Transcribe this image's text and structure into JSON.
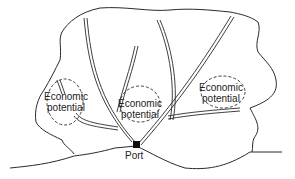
{
  "diagram": {
    "type": "map-schematic",
    "colors": {
      "line": "#2a2a2a",
      "port": "#111111",
      "background": "#ffffff"
    },
    "regions": [
      {
        "id": "left",
        "line1": "Economic",
        "line2": "potential"
      },
      {
        "id": "center",
        "line1": "Economic",
        "line2": "potential"
      },
      {
        "id": "right",
        "line1": "Economic",
        "line2": "potential"
      }
    ],
    "port": {
      "label": "Port",
      "icon": "port-square-icon"
    }
  }
}
